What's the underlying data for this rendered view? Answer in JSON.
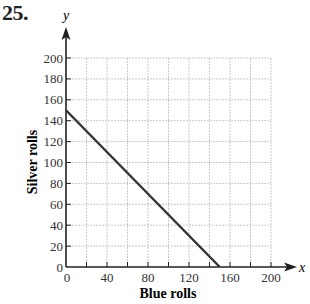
{
  "problem": {
    "number": "25."
  },
  "chart_data": {
    "type": "line",
    "title": "",
    "xlabel": "Blue rolls",
    "ylabel": "Silver rolls",
    "x_axis_var": "x",
    "y_axis_var": "y",
    "xlim": [
      0,
      200
    ],
    "ylim": [
      0,
      200
    ],
    "x_ticks": [
      0,
      40,
      80,
      120,
      160,
      200
    ],
    "y_ticks": [
      0,
      20,
      40,
      60,
      80,
      100,
      120,
      140,
      160,
      180,
      200
    ],
    "grid": true,
    "grid_step_x": 20,
    "grid_step_y": 20,
    "series": [
      {
        "name": "constraint line",
        "x": [
          0,
          150
        ],
        "y": [
          150,
          0
        ],
        "color": "#333333"
      }
    ],
    "legend": null
  },
  "colors": {
    "line": "#333333",
    "axis": "#222222",
    "grid": "#bdbdbd"
  }
}
